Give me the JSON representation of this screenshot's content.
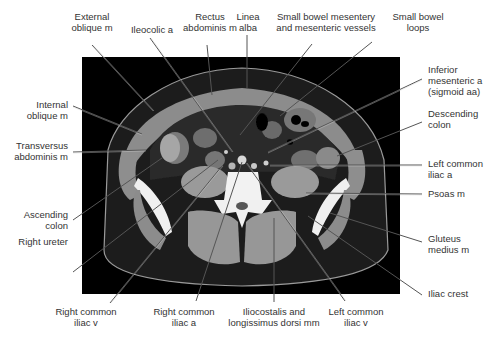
{
  "figure": {
    "type": "Axial CT image of the lower abdomen with labeled anatomy",
    "labels": {
      "top": [
        {
          "id": "external-oblique",
          "text": "External\noblique m"
        },
        {
          "id": "ileocolic-a",
          "text": "Ileocolic a"
        },
        {
          "id": "rectus-abdominis",
          "text": "Rectus\nabdominis m"
        },
        {
          "id": "linea-alba",
          "text": "Linea\nalba"
        },
        {
          "id": "small-bowel-mesentery",
          "text": "Small bowel mesentery\nand mesenteric vessels"
        },
        {
          "id": "small-bowel-loops",
          "text": "Small bowel\nloops"
        }
      ],
      "left": [
        {
          "id": "internal-oblique",
          "text": "Internal\noblique m"
        },
        {
          "id": "transversus-abdominis",
          "text": "Transversus\nabdominis m"
        },
        {
          "id": "ascending-colon",
          "text": "Ascending\ncolon"
        },
        {
          "id": "right-ureter",
          "text": "Right ureter"
        }
      ],
      "right": [
        {
          "id": "inferior-mesenteric-a",
          "text": "Inferior\nmesenteric a\n(sigmoid aa)"
        },
        {
          "id": "descending-colon",
          "text": "Descending\ncolon"
        },
        {
          "id": "left-common-iliac-a",
          "text": "Left common\niliac a"
        },
        {
          "id": "psoas",
          "text": "Psoas m"
        },
        {
          "id": "gluteus-medius",
          "text": "Gluteus\nmedius m"
        },
        {
          "id": "iliac-crest",
          "text": "Iliac crest"
        }
      ],
      "bottom": [
        {
          "id": "right-common-iliac-v",
          "text": "Right common\niliac v"
        },
        {
          "id": "right-common-iliac-a",
          "text": "Right common\niliac a"
        },
        {
          "id": "iliocostalis",
          "text": "Iliocostalis and\nlongissimus dorsi mm"
        },
        {
          "id": "left-common-iliac-v",
          "text": "Left common\niliac v"
        }
      ]
    }
  }
}
